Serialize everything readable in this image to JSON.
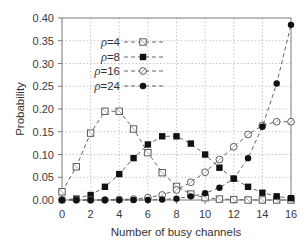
{
  "chart_data": {
    "type": "line",
    "title": "",
    "xlabel": "Number of busy channels",
    "ylabel": "Probability",
    "xlim": [
      0,
      16
    ],
    "ylim": [
      0,
      0.4
    ],
    "x_ticks": [
      0,
      2,
      4,
      6,
      8,
      10,
      12,
      14,
      16
    ],
    "y_ticks": [
      0.0,
      0.05,
      0.1,
      0.15,
      0.2,
      0.25,
      0.3,
      0.35,
      0.4
    ],
    "x_tick_labels": [
      "0",
      "2",
      "4",
      "6",
      "8",
      "10",
      "12",
      "14",
      "16"
    ],
    "y_tick_labels": [
      "0.00",
      "0.05",
      "0.10",
      "0.15",
      "0.20",
      "0.25",
      "0.30",
      "0.35",
      "0.40"
    ],
    "grid": true,
    "legend_position": "upper-left-inside",
    "x": [
      0,
      1,
      2,
      3,
      4,
      5,
      6,
      7,
      8,
      9,
      10,
      11,
      12,
      13,
      14,
      15,
      16
    ],
    "series": [
      {
        "name": "ρ = 4",
        "rho_label": "ρ",
        "rho_value": "= 4",
        "marker": "open-square",
        "values": [
          0.018,
          0.073,
          0.147,
          0.195,
          0.195,
          0.156,
          0.104,
          0.06,
          0.03,
          0.013,
          0.005,
          0.002,
          0.001,
          0.0,
          0.0,
          0.0,
          0.0
        ]
      },
      {
        "name": "ρ = 8",
        "rho_label": "ρ",
        "rho_value": "= 8",
        "marker": "filled-square",
        "values": [
          0.0,
          0.003,
          0.011,
          0.029,
          0.057,
          0.092,
          0.122,
          0.14,
          0.14,
          0.124,
          0.1,
          0.071,
          0.047,
          0.029,
          0.016,
          0.008,
          0.004
        ]
      },
      {
        "name": "ρ = 16",
        "rho_label": "ρ",
        "rho_value": "= 16",
        "marker": "open-circle",
        "values": [
          0.0,
          0.0,
          0.0,
          0.0,
          0.001,
          0.002,
          0.005,
          0.011,
          0.022,
          0.039,
          0.061,
          0.089,
          0.117,
          0.144,
          0.164,
          0.172,
          0.172
        ]
      },
      {
        "name": "ρ = 24",
        "rho_label": "ρ",
        "rho_value": "= 24",
        "marker": "filled-circle",
        "values": [
          0.0,
          0.0,
          0.0,
          0.0,
          0.0,
          0.0,
          0.0,
          0.001,
          0.003,
          0.008,
          0.015,
          0.027,
          0.047,
          0.092,
          0.161,
          0.256,
          0.385
        ]
      }
    ]
  }
}
